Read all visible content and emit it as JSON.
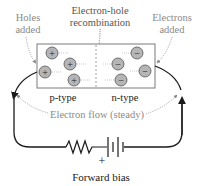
{
  "diagram": {
    "labels": {
      "holes_added_line1": "Holes",
      "holes_added_line2": "added",
      "recombination_line1": "Electron-hole",
      "recombination_line2": "recombination",
      "electrons_added_line1": "Electrons",
      "electrons_added_line2": "added",
      "p_type": "p-type",
      "n_type": "n-type",
      "electron_flow": "Electron flow (steady)",
      "plus_sign": "+",
      "forward_bias": "Forward bias"
    },
    "carriers": {
      "hole_symbol": "+",
      "electron_symbol": "−",
      "hole_count": 4,
      "electron_count": 4
    },
    "colors": {
      "annotation_gray": "#8a8a8a",
      "line_black": "#1a1a1a",
      "carrier_fill": "#b5b5b5",
      "box_stroke": "#7a7a7a"
    }
  }
}
